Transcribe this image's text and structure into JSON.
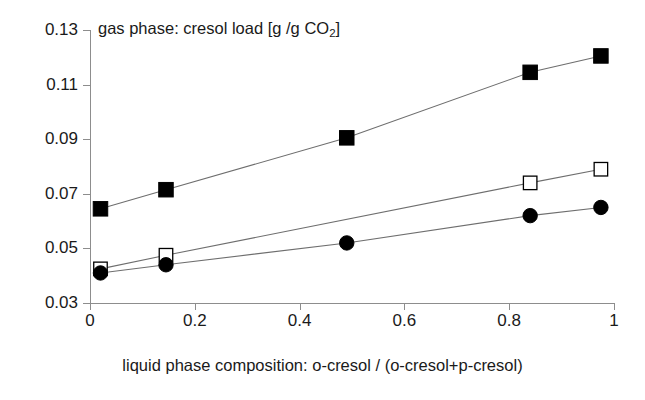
{
  "chart_data": {
    "type": "line",
    "title": "gas phase: cresol load [g /g CO2]",
    "title_main": "gas phase: cresol load [g /g CO",
    "title_sub": "2",
    "title_tail": "]",
    "xlabel": "liquid phase composition: o-cresol / (o-cresol+p-cresol)",
    "ylabel": "",
    "xlim": [
      0,
      1
    ],
    "ylim": [
      0.03,
      0.13
    ],
    "grid": false,
    "legend": "none",
    "xticks": [
      "0",
      "0.2",
      "0.4",
      "0.6",
      "0.8",
      "1"
    ],
    "xtick_values": [
      0,
      0.2,
      0.4,
      0.6,
      0.8,
      1
    ],
    "yticks": [
      "0.03",
      "0.05",
      "0.07",
      "0.09",
      "0.11",
      "0.13"
    ],
    "ytick_values": [
      0.03,
      0.05,
      0.07,
      0.09,
      0.11,
      0.13
    ],
    "series": [
      {
        "name": "filled-square-series",
        "marker": "filled-square",
        "x": [
          0.02,
          0.145,
          0.49,
          0.84,
          0.975
        ],
        "values": [
          0.0645,
          0.0715,
          0.0905,
          0.1145,
          0.1205
        ]
      },
      {
        "name": "open-square-series",
        "marker": "open-square",
        "x": [
          0.02,
          0.145,
          0.84,
          0.975
        ],
        "values": [
          0.0425,
          0.0475,
          0.074,
          0.079
        ]
      },
      {
        "name": "filled-circle-series",
        "marker": "filled-circle",
        "x": [
          0.02,
          0.145,
          0.49,
          0.84,
          0.975
        ],
        "values": [
          0.041,
          0.044,
          0.052,
          0.062,
          0.065
        ]
      }
    ],
    "colors": {
      "marker": "#000000",
      "line": "#6e6e6e",
      "axis": "#8d8d8d",
      "text": "#1a1a1a",
      "background": "#ffffff"
    }
  }
}
